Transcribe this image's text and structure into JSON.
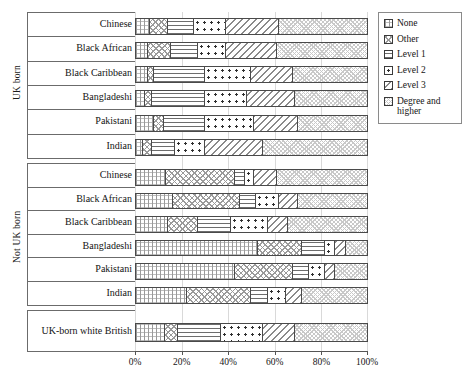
{
  "chart_data": {
    "type": "bar",
    "orientation": "horizontal",
    "stacked": true,
    "normalized_percent": true,
    "title": "",
    "xlabel": "",
    "ylabel": "",
    "xlim": [
      0,
      100
    ],
    "xticks": [
      "0%",
      "20%",
      "40%",
      "60%",
      "80%",
      "100%"
    ],
    "xtick_values": [
      0,
      20,
      40,
      60,
      80,
      100
    ],
    "grid": true,
    "legend_position": "right",
    "series": [
      {
        "name": "None",
        "pattern": "fine-crosshatch"
      },
      {
        "name": "Other",
        "pattern": "diagonal-crosshatch"
      },
      {
        "name": "Level 1",
        "pattern": "horizontal-lines"
      },
      {
        "name": "Level 2",
        "pattern": "dots"
      },
      {
        "name": "Level 3",
        "pattern": "diagonal-hatch"
      },
      {
        "name": "Degree and higher",
        "pattern": "light-crosshatch"
      }
    ],
    "groups": [
      {
        "name": "UK born",
        "categories": [
          "Chinese",
          "Black African",
          "Black Caribbean",
          "Bangladeshi",
          "Pakistani",
          "Indian"
        ],
        "values": [
          [
            6,
            8,
            11,
            14,
            23,
            38
          ],
          [
            5,
            10,
            12,
            12,
            22,
            39
          ],
          [
            5,
            3,
            22,
            20,
            18,
            32
          ],
          [
            4,
            3,
            23,
            18,
            21,
            31
          ],
          [
            8,
            4,
            18,
            21,
            19,
            30
          ],
          [
            3,
            4,
            10,
            13,
            25,
            45
          ]
        ]
      },
      {
        "name": "Not UK born",
        "categories": [
          "Chinese",
          "Black African",
          "Black Caribbean",
          "Bangladeshi",
          "Pakistani",
          "Indian"
        ],
        "values": [
          [
            13,
            30,
            4,
            4,
            10,
            39
          ],
          [
            16,
            29,
            7,
            10,
            8,
            30
          ],
          [
            14,
            13,
            14,
            16,
            9,
            34
          ],
          [
            53,
            19,
            10,
            4,
            5,
            9
          ],
          [
            43,
            25,
            7,
            7,
            4,
            14
          ],
          [
            22,
            28,
            7,
            8,
            7,
            28
          ]
        ]
      },
      {
        "name": "",
        "categories": [
          "UK-born white British"
        ],
        "values": [
          [
            12.5,
            5.5,
            19,
            18,
            14,
            31
          ]
        ]
      }
    ]
  },
  "legend": {
    "items": [
      {
        "label": "None"
      },
      {
        "label": "Other"
      },
      {
        "label": "Level 1"
      },
      {
        "label": "Level 2"
      },
      {
        "label": "Level 3"
      },
      {
        "label": "Degree and higher"
      }
    ]
  },
  "axis": {
    "group_labels": [
      "UK born",
      "Not UK born"
    ]
  }
}
